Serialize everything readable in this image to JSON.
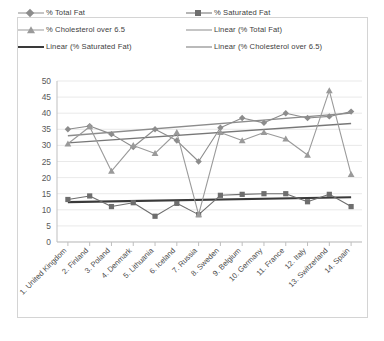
{
  "legend": {
    "rows": [
      [
        {
          "label": "% Total Fat",
          "marker": "diamond",
          "color": "#8c8c8c"
        },
        {
          "label": "% Saturated Fat",
          "marker": "square",
          "color": "#6e6e6e"
        }
      ],
      [
        {
          "label": "% Cholesterol over 6.5",
          "marker": "triangle",
          "color": "#9a9a9a"
        },
        {
          "label": "Linear (% Total Fat)",
          "marker": "line",
          "color": "#8c8c8c"
        }
      ],
      [
        {
          "label": "Linear (% Saturated Fat)",
          "marker": "thickline",
          "color": "#3a3a3a"
        },
        {
          "label": "Linear (% Cholesterol over 6.5)",
          "marker": "line",
          "color": "#777777"
        }
      ]
    ]
  },
  "chart_data": {
    "type": "line",
    "title": "",
    "xlabel": "",
    "ylabel": "",
    "ylim": [
      0,
      50
    ],
    "ytick_step": 5,
    "yticks": [
      0,
      5,
      10,
      15,
      20,
      25,
      30,
      35,
      40,
      45,
      50
    ],
    "grid": true,
    "legend_position": "top",
    "categories": [
      "1. United Kingdom",
      "2. Finland",
      "3. Poland",
      "4. Denmark",
      "5. Lithuania",
      "6. Iceland",
      "7. Russia",
      "8. Sweden",
      "9. Belgium",
      "10. Germany",
      "11. France",
      "12. Italy",
      "13. Switzerland",
      "14. Spain"
    ],
    "series": [
      {
        "name": "% Total Fat",
        "marker": "diamond",
        "color": "#8c8c8c",
        "values": [
          35.0,
          36.0,
          33.5,
          29.5,
          35.0,
          31.5,
          25.0,
          35.5,
          38.5,
          37.0,
          40.0,
          38.5,
          39.0,
          40.5
        ]
      },
      {
        "name": "% Saturated Fat",
        "marker": "square",
        "color": "#6e6e6e",
        "values": [
          13.2,
          14.3,
          11.0,
          12.2,
          8.0,
          12.0,
          8.5,
          14.5,
          14.8,
          15.0,
          15.0,
          12.5,
          14.8,
          11.0
        ]
      },
      {
        "name": "% Cholesterol over 6.5",
        "marker": "triangle",
        "color": "#9a9a9a",
        "values": [
          30.5,
          35.8,
          22.0,
          30.0,
          27.5,
          34.0,
          8.5,
          34.0,
          31.5,
          34.0,
          32.0,
          27.0,
          47.0,
          21.0
        ]
      }
    ],
    "trendlines": [
      {
        "name": "Linear (% Total Fat)",
        "color": "#8c8c8c",
        "width": 1.3,
        "start": 33.0,
        "end": 40.0
      },
      {
        "name": "Linear (% Cholesterol over 6.5)",
        "color": "#777777",
        "width": 1.3,
        "start": 30.8,
        "end": 36.8
      },
      {
        "name": "Linear (% Saturated Fat)",
        "color": "#3a3a3a",
        "width": 2.2,
        "start": 12.4,
        "end": 13.9
      }
    ]
  }
}
